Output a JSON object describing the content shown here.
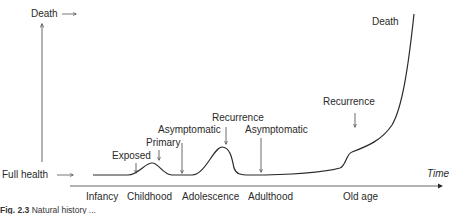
{
  "y_axis": {
    "top_label": "Death",
    "bottom_label": "Full health"
  },
  "x_axis": {
    "label": "Time",
    "stages": [
      "Infancy",
      "Childhood",
      "Adolescence",
      "Adulthood",
      "Old age"
    ]
  },
  "annotations": {
    "exposed": "Exposed",
    "primary": "Primary",
    "asymptomatic_1": "Asymptomatic",
    "recurrence_1": "Recurrence",
    "asymptomatic_2": "Asymptomatic",
    "recurrence_2": "Recurrence",
    "death": "Death"
  },
  "caption": {
    "figure_number": "Fig. 2.3",
    "text": "Natural history ..."
  },
  "colors": {
    "line": "#2a2a2a",
    "axis": "#555555"
  }
}
